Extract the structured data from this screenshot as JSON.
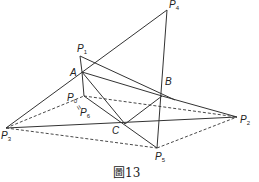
{
  "figure": {
    "caption": "圖13",
    "points": {
      "P4": {
        "label": "P",
        "sub": "4",
        "x": 167,
        "y": 10
      },
      "P1": {
        "label": "P",
        "sub": "1",
        "x": 80,
        "y": 56
      },
      "A": {
        "label": "A",
        "x": 82,
        "y": 72
      },
      "B": {
        "label": "B",
        "x": 162,
        "y": 96
      },
      "C": {
        "label": "C",
        "x": 125,
        "y": 124
      },
      "P2": {
        "label": "P",
        "sub": "2",
        "x": 237,
        "y": 117
      },
      "P3": {
        "label": "P",
        "sub": "3",
        "x": 6,
        "y": 128
      },
      "P5": {
        "label": "P",
        "sub": "5",
        "x": 157,
        "y": 148
      },
      "P0": {
        "label": "P",
        "sub": "0",
        "x": 84,
        "y": 96
      },
      "P6": {
        "label": "P",
        "sub": "6"
      },
      "equals": "="
    },
    "labels": {
      "P4_text": "P",
      "P4_sub": "4",
      "P1_text": "P",
      "P1_sub": "1",
      "A_text": "A",
      "B_text": "B",
      "C_text": "C",
      "P2_text": "P",
      "P2_sub": "2",
      "P3_text": "P",
      "P3_sub": "3",
      "P5_text": "P",
      "P5_sub": "5",
      "P0_text": "P",
      "P0_sub": "0",
      "P6_text": "P",
      "P6_sub": "6",
      "eq": "="
    },
    "colors": {
      "line": "#333333",
      "background": "#ffffff"
    }
  }
}
